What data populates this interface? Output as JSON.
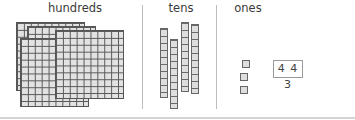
{
  "columns": {
    "hundreds": {
      "label": "hundreds",
      "count": 4
    },
    "tens": {
      "label": "tens",
      "count": 4
    },
    "ones": {
      "label": "ones",
      "count": 3
    }
  },
  "answer": {
    "value": "4 4 3"
  },
  "colors": {
    "block_fill": "#e0e0e0",
    "block_stroke": "#555555",
    "divider": "#bdbdbd"
  }
}
